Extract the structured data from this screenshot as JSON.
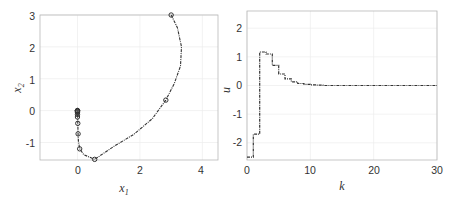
{
  "chart_data": [
    {
      "type": "line",
      "panel": "left",
      "title": "",
      "xlabel": "x_1",
      "ylabel": "x_2",
      "xlim": [
        -1.2,
        4.5
      ],
      "ylim": [
        -1.55,
        3.0
      ],
      "xticks": [
        0,
        2,
        4
      ],
      "yticks": [
        -1,
        0,
        1,
        2,
        3
      ],
      "grid": true,
      "line_style": "dash-dot",
      "markers": "circle",
      "series": [
        {
          "name": "state trajectory",
          "markers_x": [
            3.0,
            2.83,
            0.55,
            0.07,
            0.02,
            0.01,
            0.0,
            0.0,
            0.0,
            0.0,
            0.0,
            0.0,
            0.0,
            0.0,
            0.0
          ],
          "markers_y": [
            3.0,
            0.33,
            -1.53,
            -1.2,
            -0.73,
            -0.4,
            -0.2,
            -0.12,
            -0.07,
            -0.04,
            -0.02,
            -0.01,
            0.0,
            0.0,
            0.0
          ],
          "curve_x": [
            3.0,
            3.2,
            3.33,
            3.3,
            3.1,
            2.83,
            2.4,
            1.8,
            1.2,
            0.55,
            0.2,
            0.07,
            0.03,
            0.02,
            0.01,
            0.0
          ],
          "curve_y": [
            3.0,
            2.6,
            2.0,
            1.4,
            0.85,
            0.33,
            -0.25,
            -0.75,
            -1.1,
            -1.53,
            -1.38,
            -1.2,
            -0.95,
            -0.73,
            -0.4,
            0.0
          ]
        }
      ]
    },
    {
      "type": "line",
      "panel": "right",
      "title": "",
      "xlabel": "k",
      "ylabel": "u",
      "xlim": [
        0,
        30
      ],
      "ylim": [
        -2.6,
        2.6
      ],
      "xticks": [
        0,
        10,
        20,
        30
      ],
      "yticks": [
        -2,
        -1,
        0,
        1,
        2
      ],
      "grid": true,
      "line_style": "dash-dot stairs",
      "series": [
        {
          "name": "control input",
          "x": [
            0,
            1,
            2,
            3,
            4,
            5,
            6,
            7,
            8,
            9,
            10,
            11,
            12,
            13,
            14,
            15,
            16,
            17,
            18,
            19,
            20,
            21,
            22,
            23,
            24,
            25,
            26,
            27,
            28,
            29
          ],
          "values": [
            -2.5,
            -1.7,
            1.17,
            1.1,
            0.7,
            0.4,
            0.23,
            0.13,
            0.07,
            0.04,
            0.02,
            0.01,
            0.0,
            0.0,
            0.0,
            0.0,
            0.0,
            0.0,
            0.0,
            0.0,
            0.0,
            0.0,
            0.0,
            0.0,
            0.0,
            0.0,
            0.0,
            0.0,
            0.0,
            0.0
          ]
        }
      ]
    }
  ],
  "left": {
    "xlabel_main": "x",
    "xlabel_sub": "1",
    "ylabel_main": "x",
    "ylabel_sub": "2",
    "xtick_labels": [
      "0",
      "2",
      "4"
    ],
    "ytick_labels": [
      "3",
      "2",
      "1",
      "0",
      "-1"
    ]
  },
  "right": {
    "xlabel": "k",
    "ylabel": "u",
    "xtick_labels": [
      "0",
      "10",
      "20",
      "30"
    ],
    "ytick_labels": [
      "2",
      "1",
      "0",
      "-1",
      "-2"
    ]
  },
  "colors": {
    "line": "#333333",
    "grid": "#ececec",
    "axis": "#b0b0b0"
  }
}
